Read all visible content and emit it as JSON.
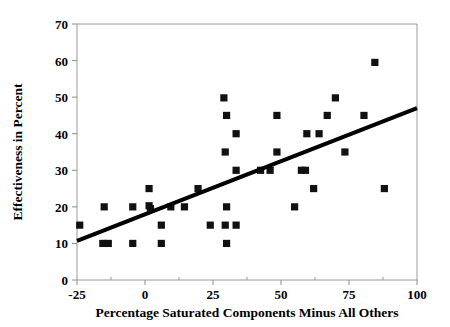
{
  "chart_data": {
    "type": "scatter",
    "title": "",
    "xlabel": "Percentage Saturated Components Minus All Others",
    "ylabel": "Effectiveness in Percent",
    "xlim": [
      -25,
      100
    ],
    "ylim": [
      0,
      70
    ],
    "xticks": [
      -25,
      0,
      25,
      50,
      75,
      100
    ],
    "yticks": [
      0,
      10,
      20,
      30,
      40,
      50,
      60,
      70
    ],
    "xtick_labels": [
      "-25",
      "0",
      "25",
      "50",
      "75",
      "100"
    ],
    "ytick_labels": [
      "0",
      "10",
      "20",
      "30",
      "40",
      "50",
      "60",
      "70"
    ],
    "grid": false,
    "legend": null,
    "marker": "square",
    "marker_color": "#111111",
    "points": [
      {
        "x": -24.0,
        "y": 15.0
      },
      {
        "x": -15.0,
        "y": 20.0
      },
      {
        "x": -15.5,
        "y": 10.0
      },
      {
        "x": -13.5,
        "y": 10.0
      },
      {
        "x": -4.5,
        "y": 20.0
      },
      {
        "x": -4.5,
        "y": 10.0
      },
      {
        "x": 1.5,
        "y": 25.0
      },
      {
        "x": 1.5,
        "y": 20.3
      },
      {
        "x": 2.0,
        "y": 19.5
      },
      {
        "x": 6.0,
        "y": 15.0
      },
      {
        "x": 6.0,
        "y": 10.0
      },
      {
        "x": 9.5,
        "y": 20.0
      },
      {
        "x": 14.5,
        "y": 20.0
      },
      {
        "x": 19.5,
        "y": 25.0
      },
      {
        "x": 24.0,
        "y": 15.0
      },
      {
        "x": 29.0,
        "y": 49.8
      },
      {
        "x": 30.0,
        "y": 45.0
      },
      {
        "x": 29.5,
        "y": 35.0
      },
      {
        "x": 30.0,
        "y": 20.0
      },
      {
        "x": 29.5,
        "y": 15.0
      },
      {
        "x": 30.0,
        "y": 10.0
      },
      {
        "x": 33.5,
        "y": 40.0
      },
      {
        "x": 33.5,
        "y": 30.0
      },
      {
        "x": 33.5,
        "y": 15.0
      },
      {
        "x": 42.5,
        "y": 30.0
      },
      {
        "x": 46.0,
        "y": 30.0
      },
      {
        "x": 48.5,
        "y": 45.0
      },
      {
        "x": 48.5,
        "y": 35.0
      },
      {
        "x": 55.0,
        "y": 20.0
      },
      {
        "x": 57.5,
        "y": 30.0
      },
      {
        "x": 59.0,
        "y": 30.0
      },
      {
        "x": 59.5,
        "y": 40.0
      },
      {
        "x": 62.0,
        "y": 25.0
      },
      {
        "x": 64.0,
        "y": 40.0
      },
      {
        "x": 67.0,
        "y": 45.0
      },
      {
        "x": 70.0,
        "y": 49.8
      },
      {
        "x": 73.5,
        "y": 35.0
      },
      {
        "x": 80.5,
        "y": 45.0
      },
      {
        "x": 84.5,
        "y": 59.5
      },
      {
        "x": 88.0,
        "y": 25.0
      }
    ],
    "fit_line": {
      "x_start": -25,
      "y_start": 10.7,
      "x_end": 100,
      "y_end": 47.0,
      "color": "#000000"
    }
  }
}
